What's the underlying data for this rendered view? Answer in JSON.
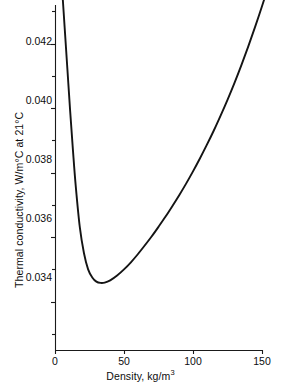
{
  "chart_data": {
    "type": "line",
    "title": "",
    "xlabel": "Density, kg/m",
    "xlabel_exponent": "3",
    "ylabel": "Thermal conductivity, W/m°C at 21°C",
    "xlim": [
      0,
      150
    ],
    "ylim": [
      0.0325,
      0.0432
    ],
    "xticks": [
      0,
      50,
      100,
      150
    ],
    "xtick_labels": [
      "0",
      "50",
      "100",
      "150"
    ],
    "yticks": [
      0.034,
      0.036,
      0.038,
      0.04,
      0.042
    ],
    "ytick_labels": [
      "0.034",
      "0.036",
      "0.038",
      "0.040",
      "0.042"
    ],
    "y_minor_ticks": [
      0.033,
      0.035,
      0.037,
      0.039,
      0.041,
      0.043
    ],
    "grid": false,
    "legend": null,
    "series": [
      {
        "name": "Thermal conductivity vs density",
        "x": [
          5,
          7,
          9,
          11,
          13,
          15,
          18,
          21,
          24,
          27,
          30,
          33,
          36,
          40,
          45,
          50,
          55,
          60,
          65,
          70,
          75,
          80,
          85,
          90,
          95,
          100,
          105,
          110,
          115,
          120,
          125,
          130,
          135,
          140,
          145,
          150,
          155,
          158
        ],
        "y": [
          0.0438,
          0.0425,
          0.0412,
          0.0399,
          0.0387,
          0.0376,
          0.0363,
          0.0355,
          0.035,
          0.03475,
          0.03462,
          0.03458,
          0.03459,
          0.03466,
          0.03481,
          0.035,
          0.03522,
          0.03547,
          0.03574,
          0.03602,
          0.03632,
          0.03663,
          0.03696,
          0.0373,
          0.03766,
          0.03804,
          0.03844,
          0.03886,
          0.0393,
          0.03977,
          0.04026,
          0.04078,
          0.04133,
          0.04191,
          0.04252,
          0.04316,
          0.04384,
          0.04426
        ]
      }
    ],
    "minimum": {
      "x": 33,
      "y": 0.03458
    }
  },
  "axes": {
    "x_tick_positions_px": [
      55,
      124,
      193,
      262
    ],
    "y_tick_positions_px": [
      277,
      218,
      159,
      100,
      41
    ],
    "plot_left_px": 55,
    "plot_right_px": 262,
    "plot_top_px": 5,
    "plot_bottom_px": 350
  },
  "colors": {
    "curve": "#141414",
    "axis": "#1a1a1a",
    "text": "#0d0d0d",
    "background": "#ffffff"
  }
}
